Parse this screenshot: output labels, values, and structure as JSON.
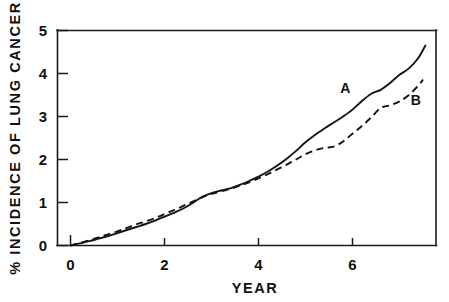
{
  "chart_data": {
    "type": "line",
    "title": "",
    "xlabel": "YEAR",
    "ylabel": "% INCIDENCE OF LUNG CANCER",
    "xlim": [
      -0.3,
      7.8
    ],
    "ylim": [
      -0.12,
      5.0
    ],
    "xticks": [
      0,
      2,
      4,
      6
    ],
    "xtick_labels": [
      "0",
      "2",
      "4",
      "6"
    ],
    "yticks": [
      0,
      1,
      2,
      3,
      4,
      5
    ],
    "ytick_labels": [
      "0",
      "1",
      "2",
      "3",
      "4",
      "5"
    ],
    "grid": false,
    "legend_position": "inline-annotation",
    "series": [
      {
        "name": "A",
        "style": "solid",
        "label": "A",
        "label_x": 5.85,
        "label_y": 3.55,
        "x": [
          0.0,
          0.2,
          0.4,
          0.6,
          0.8,
          1.0,
          1.2,
          1.4,
          1.6,
          1.8,
          2.0,
          2.2,
          2.4,
          2.6,
          2.8,
          3.0,
          3.2,
          3.4,
          3.6,
          3.8,
          4.0,
          4.2,
          4.4,
          4.6,
          4.8,
          5.0,
          5.2,
          5.4,
          5.6,
          5.8,
          6.0,
          6.2,
          6.4,
          6.6,
          6.8,
          7.0,
          7.2,
          7.4,
          7.55
        ],
        "y": [
          0.0,
          0.05,
          0.1,
          0.16,
          0.22,
          0.29,
          0.36,
          0.43,
          0.5,
          0.58,
          0.67,
          0.76,
          0.86,
          0.99,
          1.13,
          1.22,
          1.28,
          1.33,
          1.41,
          1.5,
          1.6,
          1.72,
          1.86,
          2.02,
          2.2,
          2.4,
          2.57,
          2.72,
          2.86,
          3.0,
          3.16,
          3.36,
          3.53,
          3.62,
          3.78,
          3.97,
          4.12,
          4.36,
          4.65
        ]
      },
      {
        "name": "B",
        "style": "dashed",
        "label": "B",
        "label_x": 7.35,
        "label_y": 3.27,
        "x": [
          0.0,
          0.2,
          0.4,
          0.6,
          0.8,
          1.0,
          1.2,
          1.4,
          1.6,
          1.8,
          2.0,
          2.2,
          2.4,
          2.6,
          2.8,
          3.0,
          3.2,
          3.4,
          3.6,
          3.8,
          4.0,
          4.2,
          4.4,
          4.6,
          4.8,
          5.0,
          5.2,
          5.4,
          5.6,
          5.8,
          6.0,
          6.2,
          6.4,
          6.6,
          6.8,
          7.0,
          7.2,
          7.4,
          7.5
        ],
        "y": [
          0.0,
          0.06,
          0.12,
          0.19,
          0.26,
          0.33,
          0.41,
          0.49,
          0.56,
          0.64,
          0.73,
          0.82,
          0.92,
          1.02,
          1.12,
          1.2,
          1.26,
          1.32,
          1.39,
          1.47,
          1.56,
          1.66,
          1.77,
          1.88,
          2.0,
          2.12,
          2.21,
          2.27,
          2.3,
          2.42,
          2.6,
          2.78,
          2.98,
          3.2,
          3.26,
          3.35,
          3.5,
          3.72,
          3.86
        ]
      }
    ]
  }
}
